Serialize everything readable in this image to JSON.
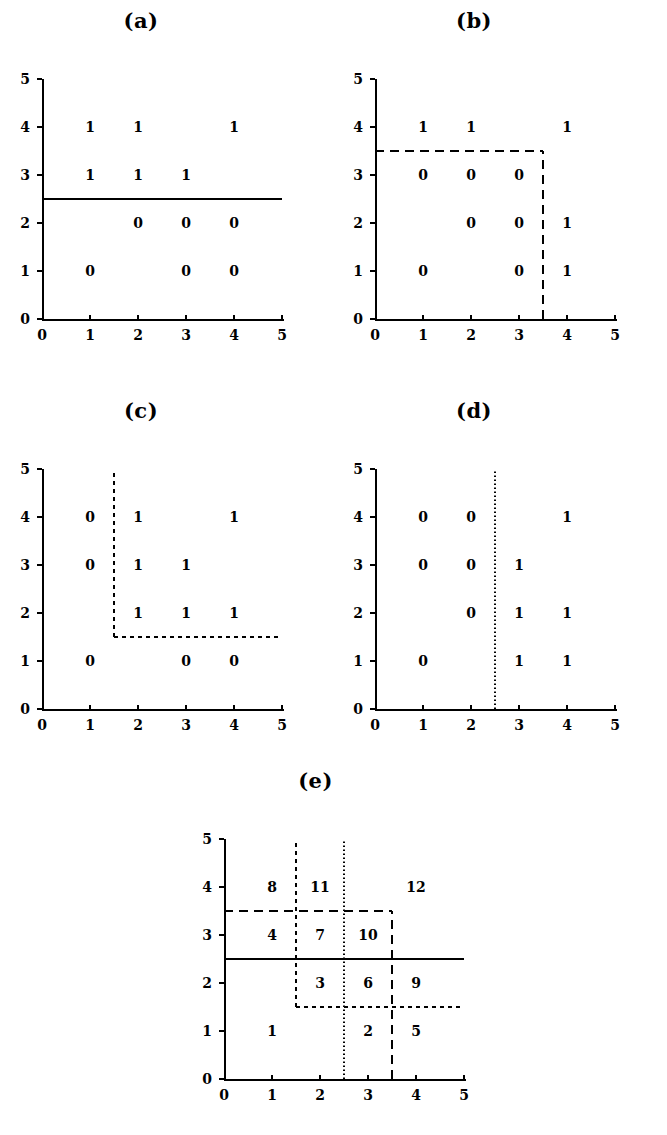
{
  "figure": {
    "panels": [
      {
        "title": "(a)",
        "axis": {
          "x_ticks": [
            "0",
            "1",
            "2",
            "3",
            "4",
            "5"
          ],
          "y_ticks": [
            "0",
            "1",
            "2",
            "3",
            "4",
            "5"
          ],
          "xlim": [
            0,
            5
          ],
          "ylim": [
            0,
            5
          ]
        },
        "points": [
          {
            "x": 1,
            "y": 4,
            "label": "1"
          },
          {
            "x": 2,
            "y": 4,
            "label": "1"
          },
          {
            "x": 4,
            "y": 4,
            "label": "1"
          },
          {
            "x": 1,
            "y": 3,
            "label": "1"
          },
          {
            "x": 2,
            "y": 3,
            "label": "1"
          },
          {
            "x": 3,
            "y": 3,
            "label": "1"
          },
          {
            "x": 2,
            "y": 2,
            "label": "0"
          },
          {
            "x": 3,
            "y": 2,
            "label": "0"
          },
          {
            "x": 4,
            "y": 2,
            "label": "0"
          },
          {
            "x": 1,
            "y": 1,
            "label": "0"
          },
          {
            "x": 3,
            "y": 1,
            "label": "0"
          },
          {
            "x": 4,
            "y": 1,
            "label": "0"
          }
        ],
        "splits": [
          {
            "orient": "h",
            "value": 2.5,
            "from": 0,
            "to": 5,
            "style": "solid"
          }
        ]
      },
      {
        "title": "(b)",
        "axis": {
          "x_ticks": [
            "0",
            "1",
            "2",
            "3",
            "4",
            "5"
          ],
          "y_ticks": [
            "0",
            "1",
            "2",
            "3",
            "4",
            "5"
          ],
          "xlim": [
            0,
            5
          ],
          "ylim": [
            0,
            5
          ]
        },
        "points": [
          {
            "x": 1,
            "y": 4,
            "label": "1"
          },
          {
            "x": 2,
            "y": 4,
            "label": "1"
          },
          {
            "x": 4,
            "y": 4,
            "label": "1"
          },
          {
            "x": 1,
            "y": 3,
            "label": "0"
          },
          {
            "x": 2,
            "y": 3,
            "label": "0"
          },
          {
            "x": 3,
            "y": 3,
            "label": "0"
          },
          {
            "x": 2,
            "y": 2,
            "label": "0"
          },
          {
            "x": 3,
            "y": 2,
            "label": "0"
          },
          {
            "x": 4,
            "y": 2,
            "label": "1"
          },
          {
            "x": 1,
            "y": 1,
            "label": "0"
          },
          {
            "x": 3,
            "y": 1,
            "label": "0"
          },
          {
            "x": 4,
            "y": 1,
            "label": "1"
          }
        ],
        "splits": [
          {
            "orient": "h",
            "value": 3.5,
            "from": 0,
            "to": 3.5,
            "style": "dashed"
          },
          {
            "orient": "v",
            "value": 3.5,
            "from": 0,
            "to": 3.5,
            "style": "dashed"
          }
        ]
      },
      {
        "title": "(c)",
        "axis": {
          "x_ticks": [
            "0",
            "1",
            "2",
            "3",
            "4",
            "5"
          ],
          "y_ticks": [
            "0",
            "1",
            "2",
            "3",
            "4",
            "5"
          ],
          "xlim": [
            0,
            5
          ],
          "ylim": [
            0,
            5
          ]
        },
        "points": [
          {
            "x": 1,
            "y": 4,
            "label": "0"
          },
          {
            "x": 2,
            "y": 4,
            "label": "1"
          },
          {
            "x": 4,
            "y": 4,
            "label": "1"
          },
          {
            "x": 1,
            "y": 3,
            "label": "0"
          },
          {
            "x": 2,
            "y": 3,
            "label": "1"
          },
          {
            "x": 3,
            "y": 3,
            "label": "1"
          },
          {
            "x": 2,
            "y": 2,
            "label": "1"
          },
          {
            "x": 3,
            "y": 2,
            "label": "1"
          },
          {
            "x": 4,
            "y": 2,
            "label": "1"
          },
          {
            "x": 1,
            "y": 1,
            "label": "0"
          },
          {
            "x": 3,
            "y": 1,
            "label": "0"
          },
          {
            "x": 4,
            "y": 1,
            "label": "0"
          }
        ],
        "splits": [
          {
            "orient": "v",
            "value": 1.5,
            "from": 1.5,
            "to": 5,
            "style": "fine"
          },
          {
            "orient": "h",
            "value": 1.5,
            "from": 1.5,
            "to": 5,
            "style": "fine"
          }
        ]
      },
      {
        "title": "(d)",
        "axis": {
          "x_ticks": [
            "0",
            "1",
            "2",
            "3",
            "4",
            "5"
          ],
          "y_ticks": [
            "0",
            "1",
            "2",
            "3",
            "4",
            "5"
          ],
          "xlim": [
            0,
            5
          ],
          "ylim": [
            0,
            5
          ]
        },
        "points": [
          {
            "x": 1,
            "y": 4,
            "label": "0"
          },
          {
            "x": 2,
            "y": 4,
            "label": "0"
          },
          {
            "x": 4,
            "y": 4,
            "label": "1"
          },
          {
            "x": 1,
            "y": 3,
            "label": "0"
          },
          {
            "x": 2,
            "y": 3,
            "label": "0"
          },
          {
            "x": 3,
            "y": 3,
            "label": "1"
          },
          {
            "x": 2,
            "y": 2,
            "label": "0"
          },
          {
            "x": 3,
            "y": 2,
            "label": "1"
          },
          {
            "x": 4,
            "y": 2,
            "label": "1"
          },
          {
            "x": 1,
            "y": 1,
            "label": "0"
          },
          {
            "x": 3,
            "y": 1,
            "label": "1"
          },
          {
            "x": 4,
            "y": 1,
            "label": "1"
          }
        ],
        "splits": [
          {
            "orient": "v",
            "value": 2.5,
            "from": 0,
            "to": 5,
            "style": "dotted"
          }
        ]
      },
      {
        "title": "(e)",
        "axis": {
          "x_ticks": [
            "0",
            "1",
            "2",
            "3",
            "4",
            "5"
          ],
          "y_ticks": [
            "0",
            "1",
            "2",
            "3",
            "4",
            "5"
          ],
          "xlim": [
            0,
            5
          ],
          "ylim": [
            0,
            5
          ]
        },
        "points": [
          {
            "x": 1,
            "y": 4,
            "label": "8"
          },
          {
            "x": 2,
            "y": 4,
            "label": "11"
          },
          {
            "x": 4,
            "y": 4,
            "label": "12"
          },
          {
            "x": 1,
            "y": 3,
            "label": "4"
          },
          {
            "x": 2,
            "y": 3,
            "label": "7"
          },
          {
            "x": 3,
            "y": 3,
            "label": "10"
          },
          {
            "x": 2,
            "y": 2,
            "label": "3"
          },
          {
            "x": 3,
            "y": 2,
            "label": "6"
          },
          {
            "x": 4,
            "y": 2,
            "label": "9"
          },
          {
            "x": 1,
            "y": 1,
            "label": "1"
          },
          {
            "x": 3,
            "y": 1,
            "label": "2"
          },
          {
            "x": 4,
            "y": 1,
            "label": "5"
          }
        ],
        "splits": [
          {
            "orient": "h",
            "value": 2.5,
            "from": 0,
            "to": 5,
            "style": "solid"
          },
          {
            "orient": "h",
            "value": 3.5,
            "from": 0,
            "to": 3.5,
            "style": "dashed"
          },
          {
            "orient": "v",
            "value": 3.5,
            "from": 0,
            "to": 3.5,
            "style": "dashed"
          },
          {
            "orient": "v",
            "value": 1.5,
            "from": 1.5,
            "to": 5,
            "style": "fine"
          },
          {
            "orient": "h",
            "value": 1.5,
            "from": 1.5,
            "to": 5,
            "style": "fine"
          },
          {
            "orient": "v",
            "value": 2.5,
            "from": 0,
            "to": 5,
            "style": "dotted"
          }
        ]
      }
    ]
  },
  "chart_data": {
    "type": "scatter",
    "title": "",
    "xlabel": "",
    "ylabel": "",
    "xlim": [
      0,
      5
    ],
    "ylim": [
      0,
      5
    ],
    "grid": false,
    "legend": null,
    "panels": [
      {
        "name": "(a)",
        "annotation": "class labels with a single horizontal solid split at y = 2.5",
        "x": [
          1,
          2,
          4,
          1,
          2,
          3,
          2,
          3,
          4,
          1,
          3,
          4
        ],
        "y": [
          4,
          4,
          4,
          3,
          3,
          3,
          2,
          2,
          2,
          1,
          1,
          1
        ],
        "labels": [
          "1",
          "1",
          "1",
          "1",
          "1",
          "1",
          "0",
          "0",
          "0",
          "0",
          "0",
          "0"
        ],
        "split_lines": [
          {
            "orient": "horizontal",
            "value": 2.5,
            "extent": [
              0,
              5
            ],
            "style": "solid"
          }
        ]
      },
      {
        "name": "(b)",
        "annotation": "dashed step boundary: y = 3.5 for x in [0,3.5], then x = 3.5 for y in [0,3.5]",
        "x": [
          1,
          2,
          4,
          1,
          2,
          3,
          2,
          3,
          4,
          1,
          3,
          4
        ],
        "y": [
          4,
          4,
          4,
          3,
          3,
          3,
          2,
          2,
          2,
          1,
          1,
          1
        ],
        "labels": [
          "1",
          "1",
          "1",
          "0",
          "0",
          "0",
          "0",
          "0",
          "1",
          "0",
          "0",
          "1"
        ],
        "split_lines": [
          {
            "orient": "horizontal",
            "value": 3.5,
            "extent": [
              0,
              3.5
            ],
            "style": "dashed"
          },
          {
            "orient": "vertical",
            "value": 3.5,
            "extent": [
              0,
              3.5
            ],
            "style": "dashed"
          }
        ]
      },
      {
        "name": "(c)",
        "annotation": "fine-dashed L boundary: x = 1.5 for y in [1.5,5], then y = 1.5 for x in [1.5,5]",
        "x": [
          1,
          2,
          4,
          1,
          2,
          3,
          2,
          3,
          4,
          1,
          3,
          4
        ],
        "y": [
          4,
          4,
          4,
          3,
          3,
          3,
          2,
          2,
          2,
          1,
          1,
          1
        ],
        "labels": [
          "0",
          "1",
          "1",
          "0",
          "1",
          "1",
          "1",
          "1",
          "1",
          "0",
          "0",
          "0"
        ],
        "split_lines": [
          {
            "orient": "vertical",
            "value": 1.5,
            "extent": [
              1.5,
              5
            ],
            "style": "fine-dashed"
          },
          {
            "orient": "horizontal",
            "value": 1.5,
            "extent": [
              1.5,
              5
            ],
            "style": "fine-dashed"
          }
        ]
      },
      {
        "name": "(d)",
        "annotation": "dotted vertical split at x = 2.5 spanning the full height",
        "x": [
          1,
          2,
          4,
          1,
          2,
          3,
          2,
          3,
          4,
          1,
          3,
          4
        ],
        "y": [
          4,
          4,
          4,
          3,
          3,
          3,
          2,
          2,
          2,
          1,
          1,
          1
        ],
        "labels": [
          "0",
          "0",
          "1",
          "0",
          "0",
          "1",
          "0",
          "1",
          "1",
          "0",
          "1",
          "1"
        ],
        "split_lines": [
          {
            "orient": "vertical",
            "value": 2.5,
            "extent": [
              0,
              5
            ],
            "style": "dotted"
          }
        ]
      },
      {
        "name": "(e)",
        "annotation": "all four boundaries overlaid, partitioning the plane into 12 numbered regions",
        "x": [
          1,
          2,
          4,
          1,
          2,
          3,
          2,
          3,
          4,
          1,
          3,
          4
        ],
        "y": [
          4,
          4,
          4,
          3,
          3,
          3,
          2,
          2,
          2,
          1,
          1,
          1
        ],
        "labels": [
          "8",
          "11",
          "12",
          "4",
          "7",
          "10",
          "3",
          "6",
          "9",
          "1",
          "2",
          "5"
        ],
        "split_lines": [
          {
            "orient": "horizontal",
            "value": 2.5,
            "extent": [
              0,
              5
            ],
            "style": "solid"
          },
          {
            "orient": "horizontal",
            "value": 3.5,
            "extent": [
              0,
              3.5
            ],
            "style": "dashed"
          },
          {
            "orient": "vertical",
            "value": 3.5,
            "extent": [
              0,
              3.5
            ],
            "style": "dashed"
          },
          {
            "orient": "vertical",
            "value": 1.5,
            "extent": [
              1.5,
              5
            ],
            "style": "fine-dashed"
          },
          {
            "orient": "horizontal",
            "value": 1.5,
            "extent": [
              1.5,
              5
            ],
            "style": "fine-dashed"
          },
          {
            "orient": "vertical",
            "value": 2.5,
            "extent": [
              0,
              5
            ],
            "style": "dotted"
          }
        ]
      }
    ]
  }
}
